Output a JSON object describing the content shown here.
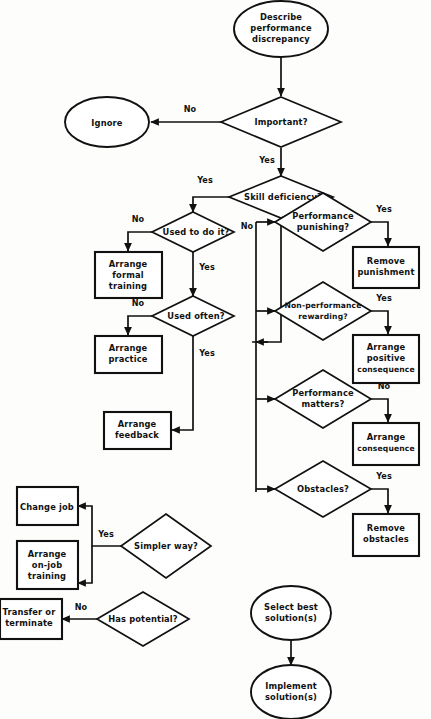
{
  "diagram": {
    "colors": {
      "stroke": "#111111",
      "fill": "#ffffff",
      "background": "#fdfdfc"
    },
    "nodes": {
      "describe": {
        "lines": [
          "Describe",
          "performance",
          "discrepancy"
        ],
        "shape": "oval"
      },
      "important": {
        "lines": [
          "Important?"
        ],
        "shape": "diamond"
      },
      "ignore": {
        "lines": [
          "Ignore"
        ],
        "shape": "oval"
      },
      "skill_deficiency": {
        "lines": [
          "Skill deficiency?"
        ],
        "shape": "diamond"
      },
      "used_to_do_it": {
        "lines": [
          "Used to do it?"
        ],
        "shape": "diamond"
      },
      "arrange_formal_training": {
        "lines": [
          "Arrange",
          "formal",
          "training"
        ],
        "shape": "box"
      },
      "used_often": {
        "lines": [
          "Used often?"
        ],
        "shape": "diamond"
      },
      "arrange_practice": {
        "lines": [
          "Arrange",
          "practice"
        ],
        "shape": "box"
      },
      "arrange_feedback": {
        "lines": [
          "Arrange",
          "feedback"
        ],
        "shape": "box"
      },
      "performance_punishing": {
        "lines": [
          "Performance",
          "punishing?"
        ],
        "shape": "diamond"
      },
      "remove_punishment": {
        "lines": [
          "Remove",
          "punishment"
        ],
        "shape": "box"
      },
      "non_performance_rewarding": {
        "lines": [
          "Non-performance",
          "rewarding?"
        ],
        "shape": "diamond"
      },
      "arrange_positive_consequence": {
        "lines": [
          "Arrange",
          "positive",
          "consequence"
        ],
        "shape": "box"
      },
      "performance_matters": {
        "lines": [
          "Performance",
          "matters?"
        ],
        "shape": "diamond"
      },
      "arrange_consequence": {
        "lines": [
          "Arrange",
          "consequence"
        ],
        "shape": "box"
      },
      "obstacles": {
        "lines": [
          "Obstacles?"
        ],
        "shape": "diamond"
      },
      "remove_obstacles": {
        "lines": [
          "Remove",
          "obstacles"
        ],
        "shape": "box"
      },
      "simpler_way": {
        "lines": [
          "Simpler way?"
        ],
        "shape": "diamond"
      },
      "change_job": {
        "lines": [
          "Change job"
        ],
        "shape": "box"
      },
      "arrange_on_job_training": {
        "lines": [
          "Arrange",
          "on-job",
          "training"
        ],
        "shape": "box"
      },
      "has_potential": {
        "lines": [
          "Has potential?"
        ],
        "shape": "diamond"
      },
      "transfer_or_terminate": {
        "lines": [
          "Transfer or",
          "terminate"
        ],
        "shape": "box"
      },
      "select_best_solutions": {
        "lines": [
          "Select best",
          "solution(s)"
        ],
        "shape": "oval"
      },
      "implement_solutions": {
        "lines": [
          "Implement",
          "solution(s)"
        ],
        "shape": "oval"
      }
    },
    "edge_labels": {
      "important_no": "No",
      "important_yes": "Yes",
      "skill_yes": "Yes",
      "skill_no": "No",
      "used_to_do_it_no": "No",
      "used_to_do_it_yes": "Yes",
      "used_often_no": "No",
      "used_often_yes": "Yes",
      "performance_punishing_yes": "Yes",
      "non_performance_rewarding_yes": "Yes",
      "performance_matters_no": "No",
      "obstacles_yes": "Yes",
      "simpler_way_yes": "Yes",
      "has_potential_no": "No"
    }
  }
}
